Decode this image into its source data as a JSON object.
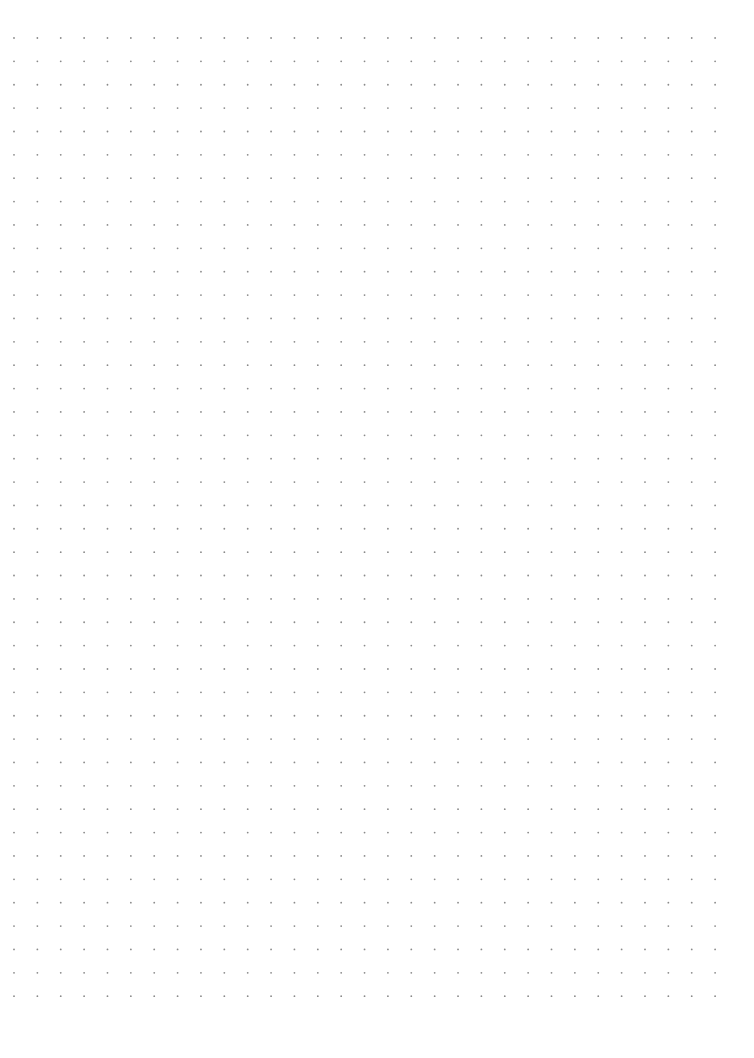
{
  "page": {
    "type": "dot-grid-paper",
    "background": "#ffffff",
    "width": 754,
    "height": 1058
  },
  "grid": {
    "columns": 31,
    "rows": 42,
    "origin_x": 14,
    "origin_y": 38,
    "spacing_x": 23.37,
    "spacing_y": 23.37,
    "dot_radius": 0.9,
    "dot_color": "#8a8a8a"
  }
}
